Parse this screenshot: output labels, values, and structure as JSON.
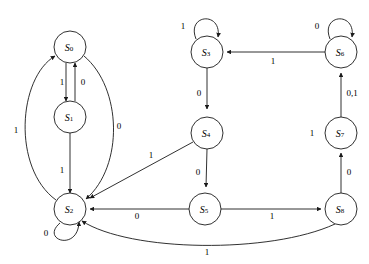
{
  "diagram": {
    "type": "finite-state-machine",
    "width": 369,
    "height": 264,
    "stroke_color": "#1a1a1a",
    "node_fill": "#ffffff",
    "node_radius": 16,
    "nodes": [
      {
        "id": "S0",
        "label": "S",
        "sub": "0",
        "cx": 70,
        "cy": 47
      },
      {
        "id": "S1",
        "label": "S",
        "sub": "1",
        "cx": 70,
        "cy": 117
      },
      {
        "id": "S2",
        "label": "S",
        "sub": "2",
        "cx": 70,
        "cy": 209
      },
      {
        "id": "S3",
        "label": "S",
        "sub": "3",
        "cx": 207,
        "cy": 52
      },
      {
        "id": "S4",
        "label": "S",
        "sub": "4",
        "cx": 207,
        "cy": 133
      },
      {
        "id": "S5",
        "label": "S",
        "sub": "5",
        "cx": 205,
        "cy": 209
      },
      {
        "id": "S6",
        "label": "S",
        "sub": "6",
        "cx": 341,
        "cy": 52
      },
      {
        "id": "S7",
        "label": "S",
        "sub": "7",
        "cx": 341,
        "cy": 133
      },
      {
        "id": "S8",
        "label": "S",
        "sub": "8",
        "cx": 341,
        "cy": 209
      }
    ],
    "edges": [
      {
        "id": "e-s0-s1",
        "from": "S0",
        "to": "S1",
        "label": "1",
        "label_x": 62,
        "label_y": 82
      },
      {
        "id": "e-s1-s0",
        "from": "S1",
        "to": "S0",
        "label": "0",
        "label_x": 83,
        "label_y": 82
      },
      {
        "id": "e-s1-s2",
        "from": "S1",
        "to": "S2",
        "label": "1",
        "label_x": 62,
        "label_y": 170
      },
      {
        "id": "e-s0-s2",
        "from": "S0",
        "to": "S2",
        "label": "0",
        "label_x": 119,
        "label_y": 126
      },
      {
        "id": "e-s2-s0",
        "from": "S2",
        "to": "S0",
        "label": "1",
        "label_x": 16,
        "label_y": 130
      },
      {
        "id": "e-s2-s2",
        "from": "S2",
        "to": "S2",
        "label": "0",
        "label_x": 46,
        "label_y": 233
      },
      {
        "id": "e-s3-s3",
        "from": "S3",
        "to": "S3",
        "label": "1",
        "label_x": 183,
        "label_y": 26
      },
      {
        "id": "e-s3-s4",
        "from": "S3",
        "to": "S4",
        "label": "0",
        "label_x": 199,
        "label_y": 93
      },
      {
        "id": "e-s4-s2",
        "from": "S4",
        "to": "S2",
        "label": "1",
        "label_x": 151,
        "label_y": 155
      },
      {
        "id": "e-s4-s5",
        "from": "S4",
        "to": "S5",
        "label": "0",
        "label_x": 198,
        "label_y": 172
      },
      {
        "id": "e-s5-s2",
        "from": "S5",
        "to": "S2",
        "label": "0",
        "label_x": 137,
        "label_y": 216
      },
      {
        "id": "e-s5-s8",
        "from": "S5",
        "to": "S8",
        "label": "1",
        "label_x": 272,
        "label_y": 216
      },
      {
        "id": "e-s6-s6",
        "from": "S6",
        "to": "S6",
        "label": "0",
        "label_x": 317,
        "label_y": 26
      },
      {
        "id": "e-s6-s3",
        "from": "S6",
        "to": "S3",
        "label": "1",
        "label_x": 273,
        "label_y": 61
      },
      {
        "id": "e-s7-s6",
        "from": "S7",
        "to": "S6",
        "label": "0,1",
        "label_x": 352,
        "label_y": 93
      },
      {
        "id": "e-s8-s7",
        "from": "S8",
        "to": "S7",
        "label": "0",
        "label_x": 349,
        "label_y": 172
      },
      {
        "id": "e-s8-s2",
        "from": "S8",
        "to": "S2",
        "label": "1",
        "label_x": 207,
        "label_y": 252
      },
      {
        "id": "lbl-s7-left",
        "from": "S7",
        "to": "S7",
        "label": "1",
        "label_x": 312,
        "label_y": 133
      }
    ]
  }
}
